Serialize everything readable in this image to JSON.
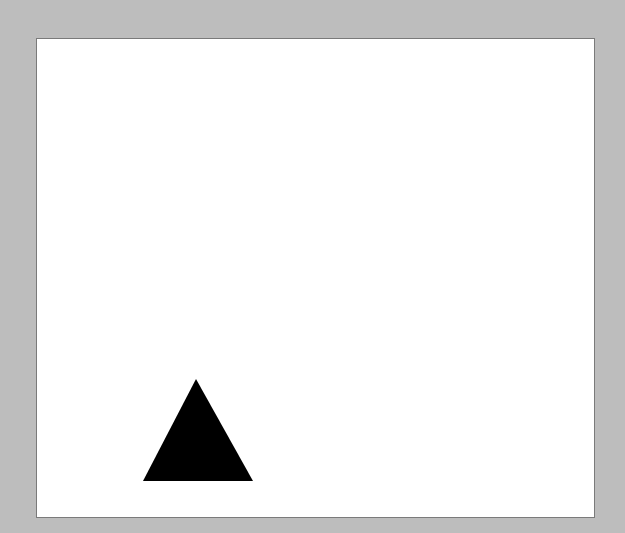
{
  "scene": {
    "background_color": "#bdbdbd",
    "canvas": {
      "color": "#ffffff",
      "border_color": "#7a7a7a"
    },
    "shapes": [
      {
        "type": "triangle",
        "fill": "#000000",
        "points": "196,379 143,481 253,481"
      }
    ]
  }
}
